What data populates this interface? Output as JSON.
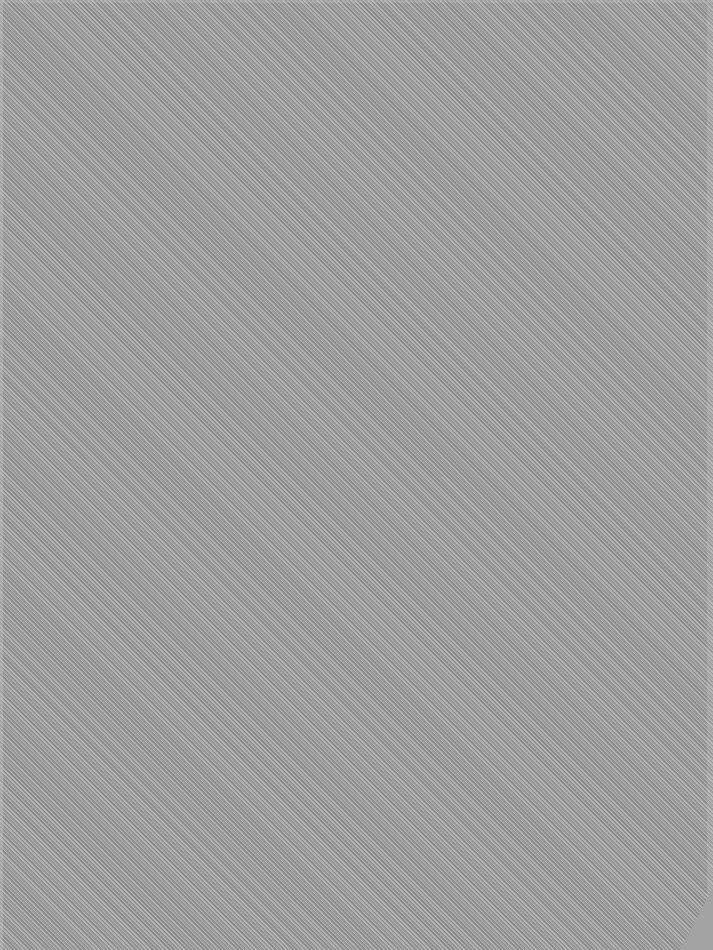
{
  "screen": {
    "description": "blank desktop background",
    "pattern": "diagonal-hatch",
    "colors": {
      "hatch_dark": "#8a8a8a",
      "hatch_light": "#b4b4b4",
      "hatch_mid": "#9c9c9c",
      "corner_fill": "#a3a3a3"
    }
  }
}
